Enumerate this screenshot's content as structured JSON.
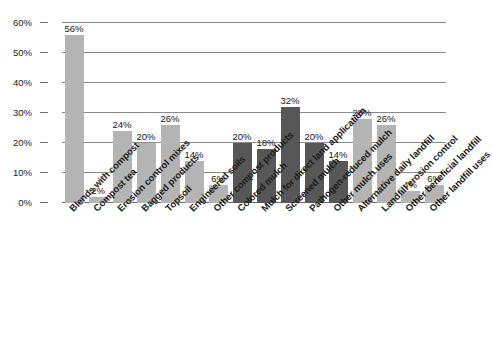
{
  "chart_data": {
    "type": "bar",
    "title": "",
    "subtitle": "",
    "xlabel": "",
    "ylabel": "",
    "ylim": [
      0,
      60
    ],
    "ytick_labels": [
      "0%",
      "10%",
      "20%",
      "30%",
      "40%",
      "50%",
      "60%"
    ],
    "ytick_values": [
      0,
      10,
      20,
      30,
      40,
      50,
      60
    ],
    "grid": true,
    "legend": "none",
    "categories": [
      "Blends with compost",
      "Compost tea",
      "Erosion control mixes",
      "Bagged products",
      "Topsoil",
      "Engineered soils",
      "Other compost products",
      "Colored mulch",
      "Mulch for direct land application",
      "Screened mulch",
      "Pathogen-reduced mulch",
      "Other mulch uses",
      "Alternative daily landfill",
      "Landfill erosion control",
      "Other beneficial landfill",
      "Other landfill uses"
    ],
    "values": [
      56,
      2,
      24,
      20,
      26,
      14,
      6,
      20,
      18,
      32,
      20,
      14,
      28,
      26,
      4,
      6
    ],
    "value_labels": [
      "56%",
      "2%",
      "24%",
      "20%",
      "26%",
      "14%",
      "6%",
      "20%",
      "18%",
      "32%",
      "20%",
      "14%",
      "28%",
      "26%",
      "4%",
      "6%"
    ],
    "bar_colors": [
      "#b4b4b4",
      "#b4b4b4",
      "#b4b4b4",
      "#b4b4b4",
      "#b4b4b4",
      "#b4b4b4",
      "#b4b4b4",
      "#575757",
      "#575757",
      "#575757",
      "#575757",
      "#575757",
      "#b4b4b4",
      "#b4b4b4",
      "#b4b4b4",
      "#b4b4b4"
    ],
    "colors": {
      "light_gray_series": "#b4b4b4",
      "dark_gray_series": "#575757",
      "gridline": "#8a8a8a",
      "text": "#1a1a1a",
      "background": "#ffffff"
    }
  }
}
